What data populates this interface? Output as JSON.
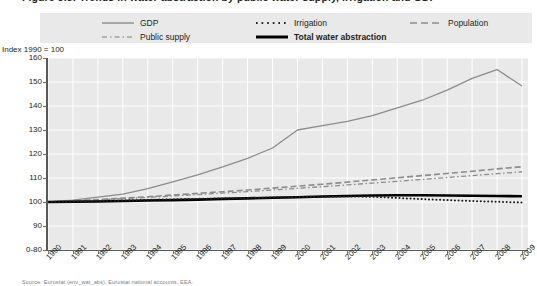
{
  "figure": {
    "title": "Figure 3.3: Trends in water abstraction by public water supply, irrigation and GDP",
    "caption": "Source: Eurostat (env_wat_abs), Eurostat national accounts, EEA."
  },
  "legend": {
    "position": "top",
    "entries": [
      {
        "label": "GDP",
        "style": "solid",
        "color": "#8c8c8c",
        "bold": false,
        "name": "legend-item-gdp"
      },
      {
        "label": "Irrigation",
        "style": "dotted",
        "color": "#231f20",
        "bold": false,
        "name": "legend-item-irrigation"
      },
      {
        "label": "Population",
        "style": "dashed",
        "color": "#8c8c8c",
        "bold": false,
        "name": "legend-item-population"
      },
      {
        "label": "Public supply",
        "style": "dashdot",
        "color": "#8c8c8c",
        "bold": false,
        "name": "legend-item-public-supply"
      },
      {
        "label": "Total water abstraction",
        "style": "thick-solid",
        "color": "#000000",
        "bold": true,
        "name": "legend-item-total-water-abstraction"
      }
    ]
  },
  "axes": {
    "y_axis_label": "Index 1990 = 100",
    "y_ticks": [
      "160",
      "150",
      "140",
      "130",
      "120",
      "110",
      "100",
      "90",
      "0-80"
    ],
    "y_min_display": 80,
    "y_max_display": 160,
    "x_ticks": [
      "1990",
      "1991",
      "1992",
      "1993",
      "1994",
      "1995",
      "1996",
      "1997",
      "1998",
      "1999",
      "2000",
      "2001",
      "2002",
      "2003",
      "2004",
      "2005",
      "2006",
      "2007",
      "2008",
      "2009"
    ],
    "grid": true,
    "axis_break": "0-80"
  },
  "chart_data": {
    "type": "line",
    "title": "Figure 3.3: Trends in water abstraction by public water supply, irrigation and GDP",
    "xlabel": "",
    "ylabel": "Index 1990 = 100",
    "ylim": [
      80,
      160
    ],
    "grid": true,
    "legend_position": "top",
    "x": [
      1990,
      1991,
      1992,
      1993,
      1994,
      1995,
      1996,
      1997,
      1998,
      1999,
      2000,
      2001,
      2002,
      2003,
      2004,
      2005,
      2006,
      2007,
      2008,
      2009
    ],
    "series": [
      {
        "name": "GDP",
        "style": "solid",
        "color": "#8c8c8c",
        "values": [
          100.0,
          100.8,
          102.0,
          103.3,
          105.6,
          108.4,
          111.3,
          114.6,
          118.2,
          122.5,
          130.0,
          131.8,
          133.6,
          136.0,
          139.2,
          142.4,
          146.6,
          151.5,
          155.2,
          148.3
        ]
      },
      {
        "name": "Population",
        "style": "dashed",
        "color": "#8c8c8c",
        "values": [
          100.0,
          100.5,
          101.0,
          101.6,
          102.2,
          102.9,
          103.6,
          104.3,
          105.0,
          105.8,
          106.6,
          107.4,
          108.3,
          109.2,
          110.1,
          111.0,
          111.9,
          112.8,
          113.8,
          114.7
        ]
      },
      {
        "name": "Public supply",
        "style": "dashdot",
        "color": "#8c8c8c",
        "values": [
          100.0,
          100.4,
          100.9,
          101.4,
          101.9,
          102.5,
          103.1,
          103.7,
          104.3,
          105.0,
          105.7,
          106.4,
          107.1,
          107.9,
          108.6,
          109.4,
          110.2,
          111.0,
          111.8,
          112.6
        ]
      },
      {
        "name": "Total water abstraction",
        "style": "thick-solid",
        "color": "#000000",
        "values": [
          100.0,
          100.1,
          100.2,
          100.4,
          100.6,
          100.8,
          101.0,
          101.3,
          101.5,
          101.8,
          102.0,
          102.3,
          102.5,
          102.7,
          102.8,
          102.8,
          102.7,
          102.6,
          102.5,
          102.4
        ]
      },
      {
        "name": "Irrigation",
        "style": "dotted",
        "color": "#231f20",
        "values": [
          100.0,
          100.2,
          100.4,
          100.6,
          100.9,
          101.1,
          101.3,
          101.5,
          101.7,
          101.9,
          102.1,
          102.2,
          102.3,
          102.2,
          101.7,
          101.2,
          100.8,
          100.4,
          100.1,
          99.8
        ]
      }
    ]
  }
}
